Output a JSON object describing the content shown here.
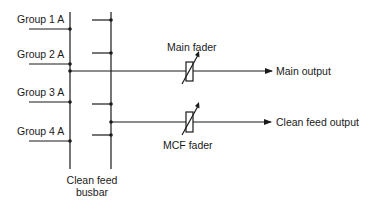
{
  "diagram": {
    "groups": [
      {
        "label": "Group 1 A"
      },
      {
        "label": "Group 2 A"
      },
      {
        "label": "Group 3 A"
      },
      {
        "label": "Group 4 A"
      }
    ],
    "busbar_label_line1": "Clean feed",
    "busbar_label_line2": "busbar",
    "main_fader_label": "Main fader",
    "mcf_fader_label": "MCF fader",
    "main_output_label": "Main output",
    "clean_feed_output_label": "Clean feed output",
    "line_color": "#1a1a1a"
  }
}
